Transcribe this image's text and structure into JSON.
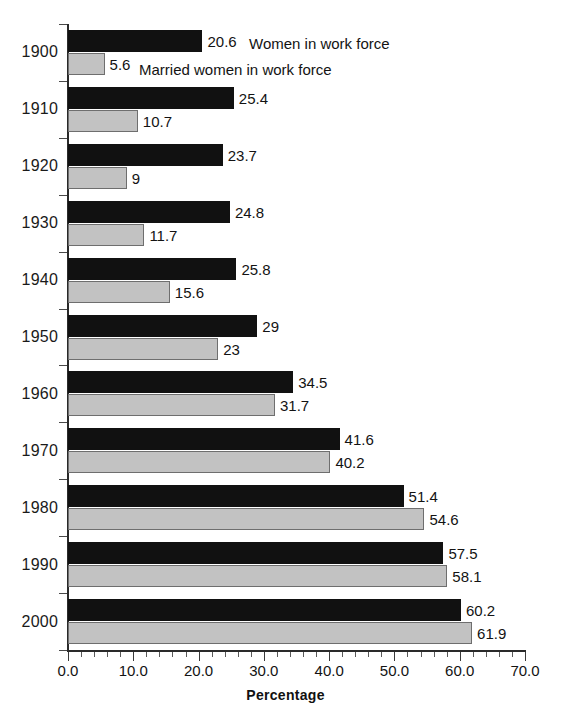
{
  "chart_data": {
    "type": "bar",
    "orientation": "horizontal",
    "title": "",
    "xlabel": "Percentage",
    "ylabel": "",
    "xlim": [
      0.0,
      70.0
    ],
    "xticks": [
      "0.0",
      "10.0",
      "20.0",
      "30.0",
      "40.0",
      "50.0",
      "60.0",
      "70.0"
    ],
    "xtick_values": [
      0,
      10,
      20,
      30,
      40,
      50,
      60,
      70
    ],
    "minor_tick_step": 2,
    "grid": false,
    "legend_position": "inline-top-right-of-first-group",
    "categories": [
      "1900",
      "1910",
      "1920",
      "1930",
      "1940",
      "1950",
      "1960",
      "1970",
      "1980",
      "1990",
      "2000"
    ],
    "series": [
      {
        "name": "Women in work force",
        "color": "#111111",
        "values": [
          20.6,
          25.4,
          23.7,
          24.8,
          25.8,
          29,
          34.5,
          41.6,
          51.4,
          57.5,
          60.2
        ],
        "labels": [
          "20.6",
          "25.4",
          "23.7",
          "24.8",
          "25.8",
          "29",
          "34.5",
          "41.6",
          "51.4",
          "57.5",
          "60.2"
        ]
      },
      {
        "name": "Married women in work force",
        "color": "#c2c2c2",
        "values": [
          5.6,
          10.7,
          9,
          11.7,
          15.6,
          23,
          31.7,
          40.2,
          54.6,
          58.1,
          61.9
        ],
        "labels": [
          "5.6",
          "10.7",
          "9",
          "11.7",
          "15.6",
          "23",
          "31.7",
          "40.2",
          "54.6",
          "58.1",
          "61.9"
        ]
      }
    ]
  },
  "legend": {
    "items": [
      {
        "label": "Women in work force"
      },
      {
        "label": "Married women in work force"
      }
    ]
  },
  "axis": {
    "x_title": "Percentage"
  }
}
